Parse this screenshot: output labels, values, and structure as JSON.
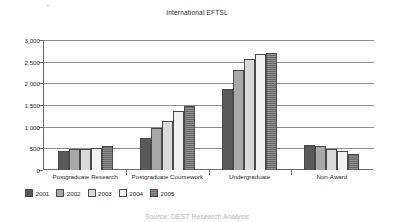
{
  "chart_data": {
    "type": "bar",
    "title": "International EFTSL",
    "xlabel": "",
    "ylabel": "",
    "categories": [
      "Postgraduate Research",
      "Postgraduate Coursework",
      "Undergraduate",
      "Non-Award"
    ],
    "series": [
      {
        "name": "2001",
        "color": "#595959",
        "values": [
          450,
          740,
          1880,
          570
        ]
      },
      {
        "name": "2002",
        "color": "#a8a8a8",
        "values": [
          480,
          965,
          2310,
          550
        ]
      },
      {
        "name": "2003",
        "color": "#d9d9d9",
        "values": [
          480,
          1120,
          2560,
          495
        ]
      },
      {
        "name": "2004",
        "color": "#f2f2f2",
        "values": [
          510,
          1360,
          2670,
          450
        ]
      },
      {
        "name": "2005",
        "color": "#8f8f8f",
        "values": [
          550,
          1470,
          2710,
          365
        ]
      }
    ],
    "ylim": [
      0,
      3000
    ],
    "yticks": [
      0,
      500,
      1000,
      1500,
      2000,
      2500,
      3000
    ],
    "ytick_labels": [
      "0",
      "500",
      "1,000",
      "1,500",
      "2,000",
      "2,500",
      "3,000"
    ],
    "grid": true,
    "legend_position": "bottom-left"
  },
  "footer": {
    "text": "Source: DEST Research Analysis"
  },
  "marks": {
    "speck": "+"
  }
}
